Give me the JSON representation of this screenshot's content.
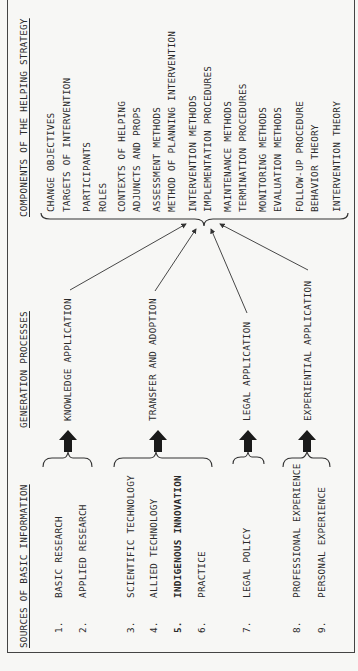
{
  "headers": {
    "sources": "SOURCES OF BASIC INFORMATION",
    "processes": "GENERATION PROCESSES",
    "components": "COMPONENTS OF THE HELPING STRATEGY"
  },
  "sources": [
    {
      "num": "1.",
      "label": "BASIC RESEARCH"
    },
    {
      "num": "2.",
      "label": "APPLIED RESEARCH"
    },
    {
      "num": "3.",
      "label": "SCIENTIFIC TECHNOLOGY"
    },
    {
      "num": "4.",
      "label": "ALLIED TECHNOLOGY"
    },
    {
      "num": "5.",
      "label": "INDIGENOUS INNOVATION"
    },
    {
      "num": "6.",
      "label": "PRACTICE"
    },
    {
      "num": "7.",
      "label": "LEGAL POLICY"
    },
    {
      "num": "8.",
      "label": "PROFESSIONAL EXPERIENCE"
    },
    {
      "num": "9.",
      "label": "PERSONAL EXPERIENCE"
    }
  ],
  "processes": [
    {
      "label": "KNOWLEDGE APPLICATION",
      "source_group": [
        "1",
        "2"
      ]
    },
    {
      "label": "TRANSFER AND ADOPTION",
      "source_group": [
        "3",
        "4",
        "5",
        "6"
      ]
    },
    {
      "label": "LEGAL APPLICATION",
      "source_group": [
        "7"
      ]
    },
    {
      "label": "EXPERIENTIAL APPLICATION",
      "source_group": [
        "8",
        "9"
      ]
    }
  ],
  "components": [
    "CHANGE OBJECTIVES",
    "TARGETS OF INTERVENTION",
    "PARTICIPANTS",
    "ROLES",
    "CONTEXTS OF HELPING",
    "ADJUNCTS AND PROPS",
    "ASSESSMENT METHODS",
    "METHOD OF PLANNING INTERVENTION",
    "INTERVENTION METHODS",
    "IMPLEMENTATION PROCEDURES",
    "MAINTENANCE METHODS",
    "TERMINATION PROCEDURES",
    "MONITORING METHODS",
    "EVALUATION METHODS",
    "FOLLOW-UP PROCEDURE",
    "BEHAVIOR THEORY",
    "INTERVENTION THEORY"
  ]
}
